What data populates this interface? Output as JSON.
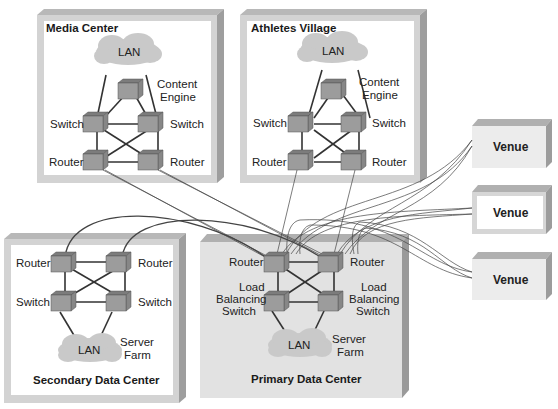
{
  "diagram": {
    "type": "network-topology",
    "colors": {
      "frame_light": "#d4d4d4",
      "frame_dark": "#a8a8a8",
      "frame_top": "#b9b9b9",
      "device_front": "#9a9a9a",
      "device_top": "#7c7c7c",
      "device_side": "#868686",
      "lan_cloud": "#c9c9c9",
      "primary_fill": "#e4e4e4",
      "venue_fill": "#ececec"
    },
    "sites": {
      "media_center": {
        "title": "Media Center",
        "lan": "LAN",
        "content_engine": "Content Engine",
        "content_engine_line1": "Content",
        "content_engine_line2": "Engine",
        "switch_left": "Switch",
        "switch_right": "Switch",
        "router_left": "Router",
        "router_right": "Router"
      },
      "athletes_village": {
        "title": "Athletes Village",
        "lan": "LAN",
        "content_engine_line1": "Content",
        "content_engine_line2": "Engine",
        "switch_left": "Switch",
        "switch_right": "Switch",
        "router_left": "Router",
        "router_right": "Router"
      },
      "secondary_dc": {
        "title": "Secondary Data Center",
        "router_left": "Router",
        "router_right": "Router",
        "switch_left": "Switch",
        "switch_right": "Switch",
        "lan": "LAN",
        "server_farm_line1": "Server",
        "server_farm_line2": "Farm"
      },
      "primary_dc": {
        "title": "Primary Data Center",
        "router_left": "Router",
        "router_right": "Router",
        "lb_left_line1": "Load",
        "lb_left_line2": "Balancing",
        "lb_left_line3": "Switch",
        "lb_right_line1": "Load",
        "lb_right_line2": "Balancing",
        "lb_right_line3": "Switch",
        "lan": "LAN",
        "server_farm_line1": "Server",
        "server_farm_line2": "Farm"
      }
    },
    "venues": [
      {
        "label": "Venue"
      },
      {
        "label": "Venue"
      },
      {
        "label": "Venue"
      }
    ]
  }
}
